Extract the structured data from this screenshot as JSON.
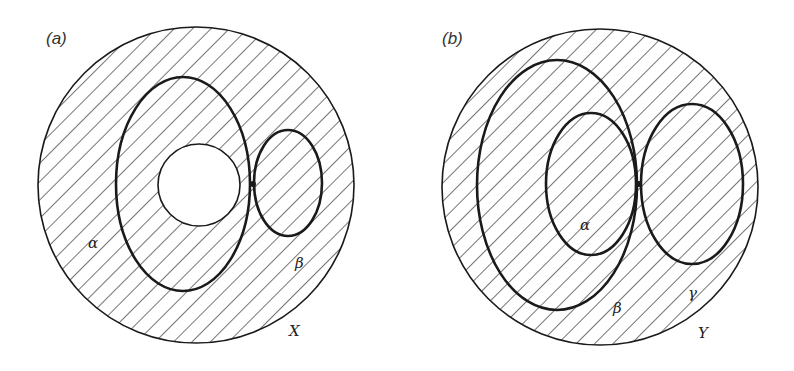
{
  "figure": {
    "panels": [
      {
        "id": "a",
        "label": "(a)",
        "outer_label": "X",
        "region_labels": [
          "α",
          "β"
        ],
        "description": "Outer circle X with hatched region; large ellipse containing an unhatched circular hole; small ellipse β tangent to the large ellipse at a point"
      },
      {
        "id": "b",
        "label": "(b)",
        "outer_label": "Y",
        "region_labels": [
          "α",
          "β",
          "γ"
        ],
        "description": "Outer circle Y fully hatched; large ellipse β containing inner ellipse α; ellipse γ tangent to both at a shared point"
      }
    ]
  },
  "style": {
    "line_color": "#1a1a1a",
    "hatch_color": "#2a2a2a",
    "background": "#ffffff"
  }
}
